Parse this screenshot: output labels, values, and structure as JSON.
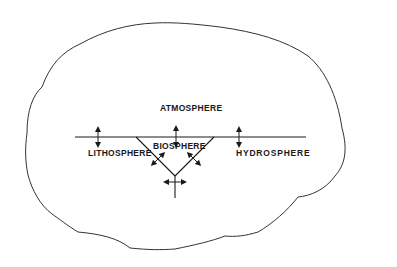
{
  "diagram": {
    "type": "concept-diagram",
    "colors": {
      "ink": "#1a1a1a",
      "outline": "#333333",
      "background": "#ffffff"
    },
    "labels": {
      "atmosphere": "ATMOSPHERE",
      "lithosphere": "LITHOSPHERE",
      "biosphere": "BIOSPHERE",
      "hydrosphere": "HYDROSPHERE"
    },
    "arrows": [
      {
        "name": "lithosphere-atmosphere-exchange",
        "kind": "vertical-double"
      },
      {
        "name": "biosphere-atmosphere-exchange",
        "kind": "vertical-double"
      },
      {
        "name": "hydrosphere-atmosphere-exchange",
        "kind": "vertical-double"
      },
      {
        "name": "biosphere-lithosphere-exchange",
        "kind": "diagonal-double"
      },
      {
        "name": "biosphere-hydrosphere-exchange",
        "kind": "diagonal-double"
      },
      {
        "name": "lithosphere-hydrosphere-exchange",
        "kind": "horizontal-double"
      }
    ]
  }
}
